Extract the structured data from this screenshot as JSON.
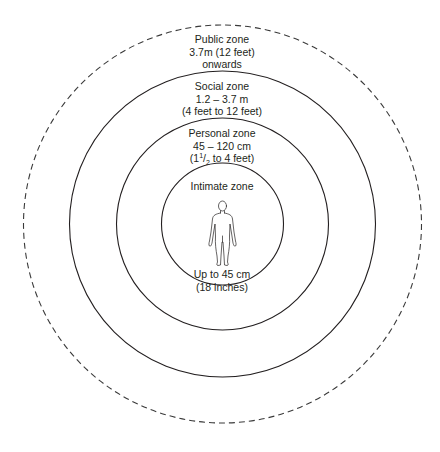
{
  "diagram": {
    "center": {
      "x": 222.5,
      "y": 224
    },
    "stroke_color": "#231f20",
    "zones": [
      {
        "name": "Public zone",
        "lines": [
          "Public zone",
          "3.7m (12 feet)",
          "onwards"
        ],
        "radius": 199,
        "style": "dashed",
        "label_top": 33
      },
      {
        "name": "Social zone",
        "lines": [
          "Social zone",
          "1.2 – 3.7 m",
          "(4 feet to 12 feet)"
        ],
        "radius": 153,
        "style": "solid",
        "label_top": 82
      },
      {
        "name": "Personal zone",
        "lines": [
          "Personal zone",
          "45 – 120 cm",
          "(1",
          "1",
          "2",
          " to 4 feet)"
        ],
        "radius": 106,
        "style": "solid",
        "label_top": 128
      },
      {
        "name": "Intimate zone",
        "lines": [
          "Intimate zone"
        ],
        "radius": 61,
        "style": "solid",
        "label_top": 180
      }
    ],
    "intimate_distance": [
      "Up to 45 cm",
      "(18 inches)"
    ],
    "figure_icon": "human-figure-icon"
  }
}
